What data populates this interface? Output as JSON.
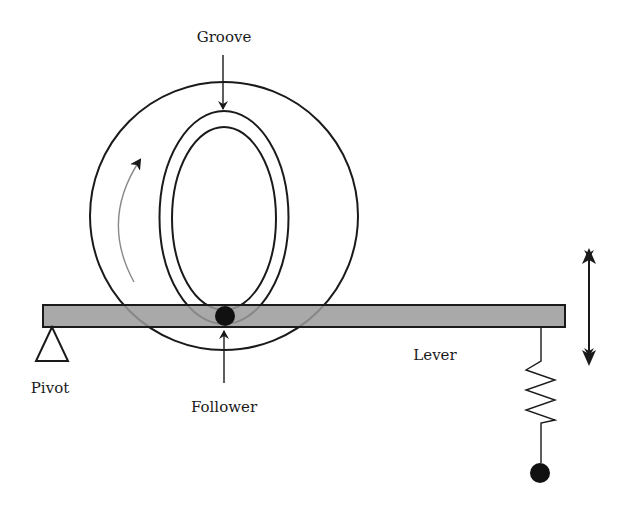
{
  "diagram": {
    "labels": {
      "groove": "Groove",
      "pivot": "Pivot",
      "follower": "Follower",
      "lever": "Lever"
    },
    "colors": {
      "line": "#1a1a1a",
      "lever_fill": "#9a9a9a",
      "rotation_arrow": "#8a8a8a",
      "background": "#ffffff"
    },
    "components": [
      {
        "id": "cam-disc",
        "shape": "circle",
        "description": "Rotating cam disc"
      },
      {
        "id": "groove-outer",
        "shape": "ellipse",
        "description": "Outer edge of groove"
      },
      {
        "id": "groove-inner",
        "shape": "ellipse",
        "description": "Inner edge of groove"
      },
      {
        "id": "rotation-arrow",
        "shape": "curved-arrow",
        "description": "Direction of cam rotation (counter-clockwise)"
      },
      {
        "id": "lever",
        "shape": "bar",
        "description": "Horizontal lever"
      },
      {
        "id": "pivot",
        "shape": "triangle",
        "description": "Pivot support at left end of lever"
      },
      {
        "id": "follower",
        "shape": "dot",
        "description": "Follower riding in groove"
      },
      {
        "id": "spring",
        "shape": "zigzag",
        "description": "Return spring at right end of lever"
      },
      {
        "id": "spring-anchor",
        "shape": "dot",
        "description": "Spring anchor point"
      },
      {
        "id": "motion-arrow",
        "shape": "double-arrow",
        "description": "Vertical oscillation of lever end"
      }
    ]
  }
}
